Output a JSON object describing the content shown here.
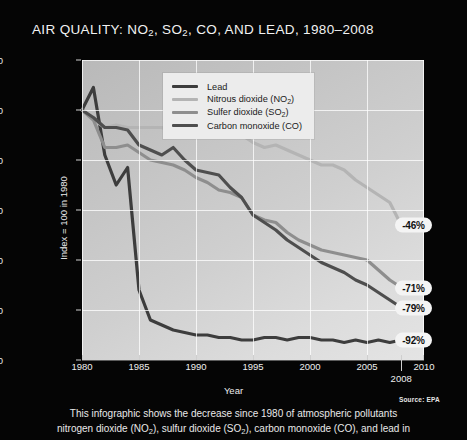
{
  "title": "AIR QUALITY: NO2, SO2, CO, AND LEAD, 1980–2008",
  "title_parts": {
    "a": "AIR QUALITY: NO",
    "sub1": "2",
    "b": ", SO",
    "sub2": "2",
    "c": ", CO, AND LEAD, 1980–2008"
  },
  "axes": {
    "ylabel": "Index = 100 in 1980",
    "xlabel": "Year",
    "yticks": [
      "0",
      "20",
      "40",
      "60",
      "80",
      "100",
      "120"
    ],
    "xticks": [
      "1980",
      "1985",
      "1990",
      "1995",
      "2000",
      "2005",
      "2010"
    ],
    "x_extra_tick": "2008"
  },
  "legend": {
    "items": [
      {
        "label": "Lead",
        "color": "#3d3d3d"
      },
      {
        "label": "Nitrous dioxide (NO2)",
        "text_a": "Nitrous dioxide (NO",
        "sub": "2",
        "text_b": ")",
        "color": "#b4b4b4"
      },
      {
        "label": "Sulfer dioxide (SO2)",
        "text_a": "Sulfer dioxide (SO",
        "sub": "2",
        "text_b": ")",
        "color": "#8e8e8e"
      },
      {
        "label": "Carbon monoxide (CO)",
        "text_a": "Carbon monoxide (CO)",
        "sub": "",
        "text_b": "",
        "color": "#4e4e4e"
      }
    ]
  },
  "callouts": [
    {
      "name": "no2-change",
      "text": "-46%",
      "value": 54
    },
    {
      "name": "so2-change",
      "text": "-71%",
      "value": 29
    },
    {
      "name": "co-change",
      "text": "-79%",
      "value": 21
    },
    {
      "name": "lead-change",
      "text": "-92%",
      "value": 8
    }
  ],
  "source": "Source: EPA",
  "caption_line1": "This infographic shows the decrease since 1980 of atmospheric pollutants",
  "caption_line2_a": "nitrogen dioxide (NO",
  "caption_line2_sub1": "2",
  "caption_line2_b": "), sulfur dioxide (SO",
  "caption_line2_sub2": "2",
  "caption_line2_c": "), carbon monoxide (CO), and lead in",
  "chart_data": {
    "type": "line",
    "title": "AIR QUALITY: NO2, SO2, CO, AND LEAD, 1980–2008",
    "xlabel": "Year",
    "ylabel": "Index = 100 in 1980",
    "xlim": [
      1980,
      2010
    ],
    "ylim": [
      0,
      120
    ],
    "grid": true,
    "legend_position": "top-right-inside",
    "x": [
      1980,
      1981,
      1982,
      1983,
      1984,
      1985,
      1986,
      1987,
      1988,
      1989,
      1990,
      1991,
      1992,
      1993,
      1994,
      1995,
      1996,
      1997,
      1998,
      1999,
      2000,
      2001,
      2002,
      2003,
      2004,
      2005,
      2006,
      2007,
      2008
    ],
    "series": [
      {
        "name": "Lead",
        "color": "#3d3d3d",
        "end_label": "-92%",
        "values": [
          100,
          109,
          82,
          70,
          77,
          28,
          16,
          14,
          12,
          11,
          10,
          10,
          9,
          9,
          8,
          8,
          9,
          9,
          8,
          9,
          9,
          8,
          8,
          7,
          8,
          7,
          8,
          7,
          8
        ]
      },
      {
        "name": "Nitrous dioxide (NO2)",
        "color": "#b4b4b4",
        "end_label": "-46%",
        "values": [
          100,
          96,
          93,
          94,
          93,
          93,
          93,
          93,
          91,
          92,
          93,
          92,
          91,
          92,
          90,
          87,
          85,
          86,
          84,
          82,
          80,
          78,
          78,
          76,
          72,
          69,
          66,
          63,
          54
        ]
      },
      {
        "name": "Sulfer dioxide (SO2)",
        "color": "#8e8e8e",
        "end_label": "-71%",
        "values": [
          100,
          96,
          85,
          85,
          86,
          83,
          80,
          79,
          78,
          76,
          73,
          71,
          68,
          67,
          65,
          58,
          56,
          55,
          51,
          48,
          46,
          44,
          43,
          42,
          41,
          40,
          36,
          32,
          29
        ]
      },
      {
        "name": "Carbon monoxide (CO)",
        "color": "#4e4e4e",
        "end_label": "-79%",
        "values": [
          100,
          97,
          93,
          93,
          92,
          86,
          84,
          82,
          85,
          80,
          76,
          75,
          74,
          69,
          65,
          58,
          55,
          52,
          48,
          45,
          42,
          39,
          37,
          35,
          32,
          30,
          27,
          24,
          21
        ]
      }
    ]
  }
}
